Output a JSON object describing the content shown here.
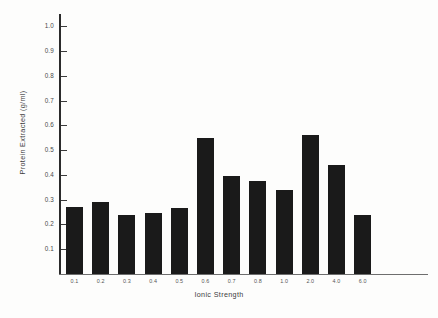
{
  "chart_data": {
    "type": "bar",
    "title": "",
    "xlabel": "Ionic Strength",
    "ylabel": "Protein Extracted (g/ml)",
    "categories": [
      "0.1",
      "0.2",
      "0.3",
      "0.4",
      "0.5",
      "0.6",
      "0.7",
      "0.8",
      "1.0",
      "2.0",
      "4.0",
      "6.0"
    ],
    "values": [
      0.27,
      0.29,
      0.24,
      0.245,
      0.265,
      0.55,
      0.395,
      0.375,
      0.34,
      0.56,
      0.44,
      0.24
    ],
    "ylim": [
      0.0,
      1.05
    ],
    "ytick_values": [
      0.1,
      0.2,
      0.3,
      0.4,
      0.5,
      0.6,
      0.7,
      0.8,
      0.9,
      1.0
    ],
    "ytick_labels": [
      "0.1",
      "0.2",
      "0.3",
      "0.4",
      "0.5",
      "0.6",
      "0.7",
      "0.8",
      "0.9",
      "1.0"
    ],
    "grid": false,
    "legend": "none",
    "bar_color": "#1a1a1a",
    "axis_color": "#2b2b2b",
    "background_color": "#fdfdfc"
  }
}
